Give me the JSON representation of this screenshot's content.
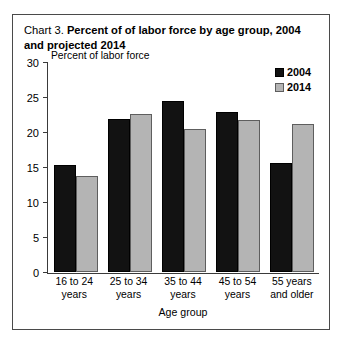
{
  "figure": {
    "title_label": "Chart 3.",
    "title_text": "Percent of of labor force by age group, 2004 and projected 2014"
  },
  "chart_data": {
    "type": "bar",
    "title": "Chart 3. Percent of of labor force by age group, 2004 and projected 2014",
    "xlabel": "Age group",
    "ylabel": "Percent of labor force",
    "ylim": [
      0,
      30
    ],
    "yticks": [
      0,
      5,
      10,
      15,
      20,
      25,
      30
    ],
    "grid": false,
    "legend_position": "top-right",
    "categories": [
      "16 to 24 years",
      "25 to 34 years",
      "35 to 44 years",
      "45 to 54 years",
      "55 years and older"
    ],
    "series": [
      {
        "name": "2004",
        "color": "#121212",
        "values": [
          15.3,
          22.0,
          24.5,
          23.0,
          15.6
        ]
      },
      {
        "name": "2014",
        "color": "#b4b4b4",
        "values": [
          13.7,
          22.6,
          20.5,
          21.8,
          21.2
        ]
      }
    ]
  }
}
